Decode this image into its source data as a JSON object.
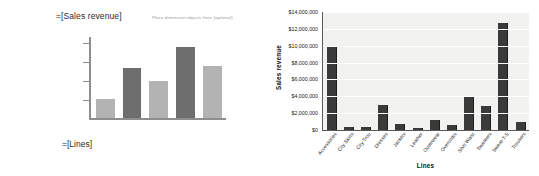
{
  "design_pane": {
    "value_axis_placeholder": "=[Sales revenue]",
    "dimension_dropzone": "Place dimension objects here (optional)",
    "category_axis_placeholder": "=[Lines]",
    "preview_bars": [
      {
        "height_pct": 24,
        "tone": "light"
      },
      {
        "height_pct": 62,
        "tone": "dark"
      },
      {
        "height_pct": 46,
        "tone": "light"
      },
      {
        "height_pct": 88,
        "tone": "dark"
      },
      {
        "height_pct": 64,
        "tone": "light"
      }
    ],
    "bar_color_light": "#b3b3b3",
    "bar_color_dark": "#6e6e6e"
  },
  "chart_data": {
    "type": "bar",
    "title": "",
    "xlabel": "Lines",
    "ylabel": "Sales revenue",
    "grid": true,
    "legend": "none",
    "ylim": [
      0,
      14000000
    ],
    "ytick_labels": [
      "$14,000,000",
      "$12,000,000",
      "$10,000,000",
      "$8,000,000",
      "$6,000,000",
      "$4,000,000",
      "$2,000,000",
      "$0"
    ],
    "ytick_values": [
      14000000,
      12000000,
      10000000,
      8000000,
      6000000,
      4000000,
      2000000,
      0
    ],
    "categories": [
      "Accessories",
      "City Skirts",
      "City Trou",
      "Dresses",
      "Jackets",
      "Leather",
      "Outerwear",
      "Overcoats",
      "Shirt Waist",
      "Sweaters",
      "Sweat-T-S",
      "Trousers"
    ],
    "values": [
      9900000,
      400000,
      380000,
      2950000,
      750000,
      270000,
      1200000,
      540000,
      4000000,
      2900000,
      12700000,
      900000
    ],
    "bar_color": "#3a3a3a",
    "plot_background": "#f2f2f0"
  }
}
